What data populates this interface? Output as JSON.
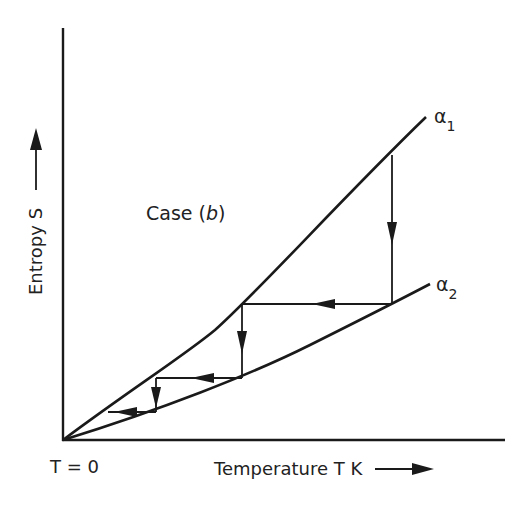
{
  "diagram": {
    "case_label": "Case (",
    "case_letter": "b",
    "case_close": ")",
    "y_axis_label": "Entropy S",
    "x_axis_label": "Temperature T K",
    "origin_label": "T = 0",
    "curve1_label": "α",
    "curve1_sub": "1",
    "curve2_label": "α",
    "curve2_sub": "2",
    "ink_color": "#1a1a1a"
  }
}
